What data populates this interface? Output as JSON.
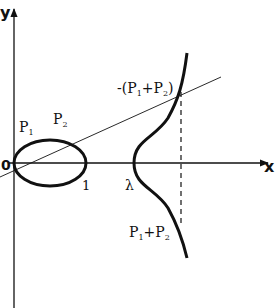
{
  "figure": {
    "title": "",
    "axes": {
      "x_label": "x",
      "y_label": "y",
      "origin_label": "0"
    },
    "tick_labels": {
      "one": "1",
      "lambda": "λ"
    },
    "points": {
      "p1": {
        "main": "P",
        "sub": "1"
      },
      "p2": {
        "main": "P",
        "sub": "2"
      }
    },
    "annotations": {
      "neg_sum": {
        "prefix": "-(P",
        "sub1": "1",
        "mid": "+P",
        "sub2": "2",
        "suffix": ")"
      },
      "sum": {
        "p": "P",
        "sub1": "1",
        "mid": "+P",
        "sub2": "2"
      }
    },
    "colors": {
      "ink": "#111111",
      "background": "#ffffff"
    }
  }
}
